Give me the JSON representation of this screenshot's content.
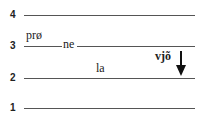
{
  "diagram": {
    "type": "tone-level-diagram",
    "levels": [
      {
        "label": "4"
      },
      {
        "label": "3"
      },
      {
        "label": "2"
      },
      {
        "label": "1"
      }
    ],
    "syllables": [
      {
        "text": "prø",
        "level": "above 3"
      },
      {
        "text": "ne",
        "level": "3"
      },
      {
        "text": "la",
        "level": "between 2 and 3"
      },
      {
        "text": "vjõ",
        "level": "falling from 3 toward 2",
        "bold": true
      }
    ],
    "arrow": {
      "direction": "down",
      "color": "#111111"
    },
    "line_color": "#555555"
  }
}
